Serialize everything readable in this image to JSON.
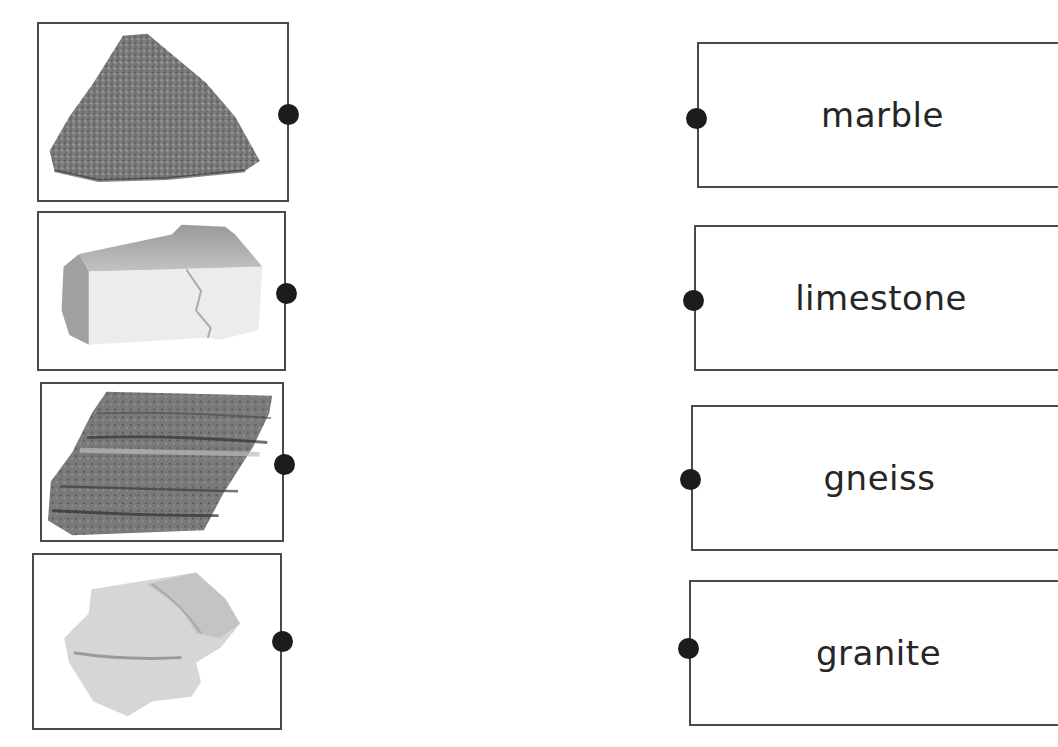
{
  "worksheet": {
    "images": [
      {
        "rock": "granite",
        "description": "speckled gray coarse-grained rock"
      },
      {
        "rock": "marble",
        "description": "white blocky rock"
      },
      {
        "rock": "gneiss",
        "description": "banded striped gray rock"
      },
      {
        "rock": "limestone",
        "description": "pale rough rock"
      }
    ],
    "words": [
      {
        "label": "marble"
      },
      {
        "label": "limestone"
      },
      {
        "label": "gneiss"
      },
      {
        "label": "granite"
      }
    ],
    "colors": {
      "border": "#4a4a4a",
      "dot": "#1c1c1c",
      "text": "#262626"
    }
  }
}
